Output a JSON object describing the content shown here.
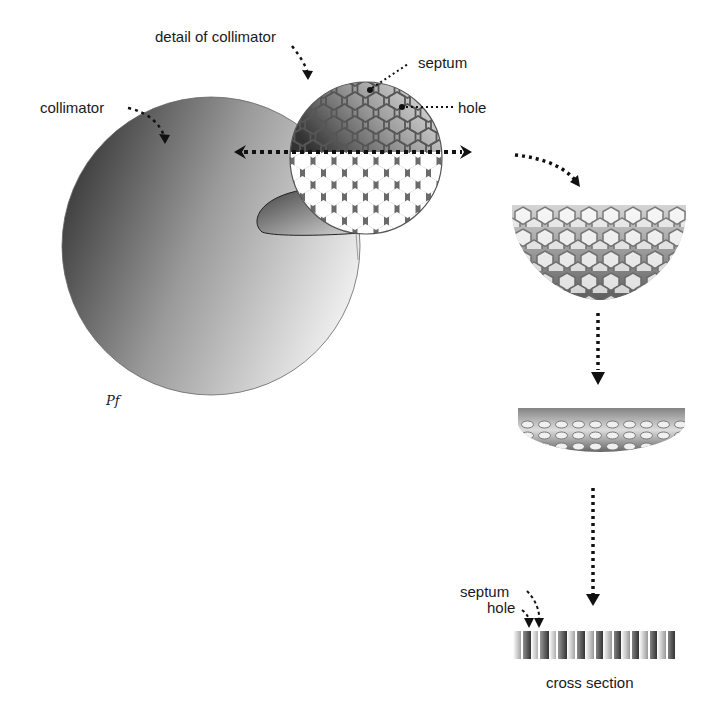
{
  "labels": {
    "detail": "detail of collimator",
    "collimator": "collimator",
    "septum_top": "septum",
    "hole_top": "hole",
    "septum_bottom": "septum",
    "hole_bottom": "hole",
    "cross_section": "cross section",
    "signature": "Pf"
  },
  "colors": {
    "dark_gray": "#3a3a3a",
    "mid_gray": "#8c8c8c",
    "light_gray": "#e8e8e8",
    "septum": "#555555",
    "arrow": "#111111"
  },
  "icons": [
    "dotted-arrow-icon",
    "double-headed-arrow-icon",
    "hexagon-grid-icon"
  ]
}
